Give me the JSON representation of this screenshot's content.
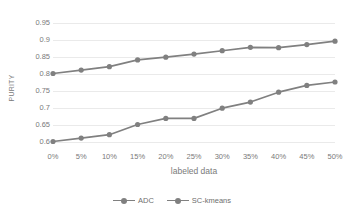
{
  "chart_data": {
    "type": "line",
    "title": "",
    "xlabel": "labeled data",
    "ylabel": "PURITY",
    "categories": [
      "0%",
      "5%",
      "10%",
      "15%",
      "20%",
      "25%",
      "30%",
      "35%",
      "40%",
      "45%",
      "50%"
    ],
    "x_values": [
      0,
      5,
      10,
      15,
      20,
      25,
      30,
      35,
      40,
      45,
      50
    ],
    "series": [
      {
        "name": "ADC",
        "color": "#808080",
        "marker": "circle",
        "values": [
          0.8,
          0.81,
          0.82,
          0.84,
          0.848,
          0.857,
          0.867,
          0.877,
          0.876,
          0.885,
          0.895
        ]
      },
      {
        "name": "SC-kmeans",
        "color": "#808080",
        "marker": "circle",
        "values": [
          0.6,
          0.61,
          0.62,
          0.65,
          0.668,
          0.668,
          0.698,
          0.716,
          0.745,
          0.765,
          0.775
        ]
      }
    ],
    "ylim": [
      0.575,
      0.975
    ],
    "y_ticks": [
      0.6,
      0.65,
      0.7,
      0.75,
      0.8,
      0.85,
      0.9,
      0.95
    ],
    "y_tick_labels": [
      "0.6",
      "0.65",
      "0.7",
      "0.75",
      "0.8",
      "0.85",
      "0.9",
      "0.95"
    ],
    "xlim": [
      0,
      50
    ],
    "grid": "horizontal",
    "grid_color": "#eaeaea",
    "legend_position": "bottom",
    "axis_text_color": "#7a7a7a"
  },
  "legend": {
    "entries": [
      {
        "label": "ADC"
      },
      {
        "label": "SC-kmeans"
      }
    ]
  }
}
